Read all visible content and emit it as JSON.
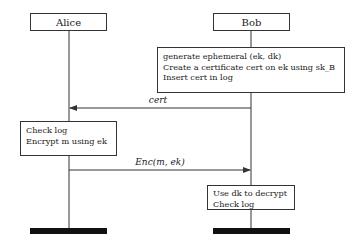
{
  "actors": [
    {
      "name": "Alice"
    },
    {
      "name": "Bob"
    }
  ],
  "notes": {
    "bob_setup": {
      "lines": [
        "generate ephemeral (ek, dk)",
        "Create a certificate cert on ek using sk_B",
        "Insert cert in log"
      ]
    },
    "alice_action": {
      "lines": [
        "Check log",
        "Encrypt m using ek"
      ]
    },
    "bob_finish": {
      "lines": [
        "Use dk to decrypt",
        "Check log"
      ]
    }
  },
  "messages": [
    {
      "label": "cert",
      "from": "Bob",
      "to": "Alice"
    },
    {
      "label": "Enc(m, ek)",
      "from": "Alice",
      "to": "Bob"
    }
  ],
  "colors": {
    "line": "#333333",
    "terminator": "#111111",
    "background": "#ffffff"
  }
}
